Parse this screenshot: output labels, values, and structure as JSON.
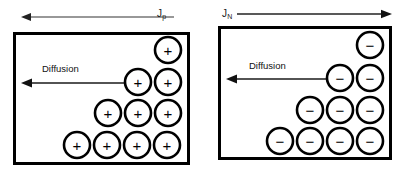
{
  "figure": {
    "background_color": "#ffffff",
    "ink_color": "#000000"
  },
  "panels": [
    {
      "id": "holes",
      "name": "hole-diffusion-panel",
      "flux": {
        "label_base": "J",
        "label_subscript": "p",
        "arrow_direction": "left",
        "label_position": "right"
      },
      "diffusion": {
        "label": "Diffusion",
        "arrow_direction": "left"
      },
      "carrier": {
        "sign": "+",
        "icon": "plus-circle-icon",
        "name": "hole"
      },
      "box": {
        "x": 13,
        "y": 32,
        "width": 177,
        "height": 133,
        "stroke": 3
      },
      "rows": [
        {
          "count": 1,
          "cy": 50,
          "cx_start": 168
        },
        {
          "count": 2,
          "cy": 82,
          "cx_start": 138
        },
        {
          "count": 3,
          "cy": 113,
          "cx_start": 108
        },
        {
          "count": 4,
          "cy": 145,
          "cx_start": 77
        }
      ],
      "circle_radius": 13,
      "circle_spacing": 30
    },
    {
      "id": "electrons",
      "name": "electron-diffusion-panel",
      "flux": {
        "label_base": "J",
        "label_subscript": "N",
        "arrow_direction": "right",
        "label_position": "left"
      },
      "diffusion": {
        "label": "Diffusion",
        "arrow_direction": "left"
      },
      "carrier": {
        "sign": "−",
        "icon": "minus-circle-icon",
        "name": "electron"
      },
      "box": {
        "x": 15,
        "y": 26,
        "width": 174,
        "height": 134,
        "stroke": 3
      },
      "rows": [
        {
          "count": 1,
          "cy": 45,
          "cx_start": 167
        },
        {
          "count": 2,
          "cy": 78,
          "cx_start": 137
        },
        {
          "count": 3,
          "cy": 110,
          "cx_start": 107
        },
        {
          "count": 4,
          "cy": 141,
          "cx_start": 77
        }
      ],
      "circle_radius": 13,
      "circle_spacing": 30
    }
  ],
  "flux_arrows": {
    "holes": {
      "x1": 174,
      "x2": 21,
      "y": 17,
      "head": "left"
    },
    "electrons": {
      "x1": 34,
      "x2": 188,
      "y": 14,
      "head": "right"
    }
  },
  "diffusion_arrows": {
    "holes": {
      "x1": 125,
      "x2": 22,
      "y": 83,
      "head": "left"
    },
    "electrons": {
      "x1": 128,
      "x2": 24,
      "y": 79,
      "head": "left"
    }
  }
}
